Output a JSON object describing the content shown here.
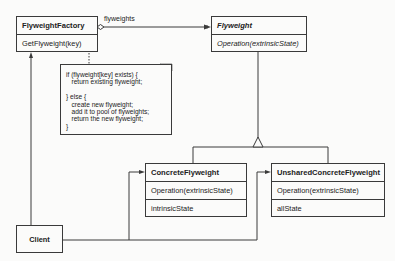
{
  "diagram": {
    "type": "UML class diagram",
    "pattern": "Flyweight",
    "classes": [
      {
        "id": "flyweight_factory",
        "name": "FlyweightFactory",
        "abstract": false,
        "operations": [
          "GetFlyweight(key)"
        ],
        "attributes": []
      },
      {
        "id": "flyweight",
        "name": "Flyweight",
        "abstract": true,
        "operations": [
          "Operation(extrinsicState)"
        ],
        "attributes": []
      },
      {
        "id": "concrete_flyweight",
        "name": "ConcreteFlyweight",
        "abstract": false,
        "operations": [
          "Operation(extrinsicState)"
        ],
        "attributes": [
          "intrinsicState"
        ]
      },
      {
        "id": "unshared_concrete_flyweight",
        "name": "UnsharedConcreteFlyweight",
        "abstract": false,
        "operations": [
          "Operation(extrinsicState)"
        ],
        "attributes": [
          "allState"
        ]
      },
      {
        "id": "client",
        "name": "Client",
        "abstract": false,
        "operations": [],
        "attributes": []
      }
    ],
    "note": {
      "attached_to": "GetFlyweight(key)",
      "lines": [
        "if (flyweight[key] exists) {",
        "   return existing flyweight;",
        "",
        "} else {",
        "   create new flyweight;",
        "   add it to pool of flyweights;",
        "   return the new flyweight;",
        "}"
      ]
    },
    "relationships": [
      {
        "from": "FlyweightFactory",
        "to": "Flyweight",
        "kind": "aggregation",
        "label": "flyweights"
      },
      {
        "from": "ConcreteFlyweight",
        "to": "Flyweight",
        "kind": "inheritance"
      },
      {
        "from": "UnsharedConcreteFlyweight",
        "to": "Flyweight",
        "kind": "inheritance"
      },
      {
        "from": "Client",
        "to": "FlyweightFactory",
        "kind": "association"
      },
      {
        "from": "Client",
        "to": "ConcreteFlyweight",
        "kind": "association"
      },
      {
        "from": "Client",
        "to": "UnsharedConcreteFlyweight",
        "kind": "association"
      }
    ]
  },
  "labels": {
    "factory_title": "FlyweightFactory",
    "factory_op": "GetFlyweight(key)",
    "flyweight_title": "Flyweight",
    "flyweight_op": "Operation(extrinsicState)",
    "concrete_title": "ConcreteFlyweight",
    "concrete_op": "Operation(extrinsicState)",
    "concrete_attr": "intrinsicState",
    "unshared_title": "UnsharedConcreteFlyweight",
    "unshared_op": "Operation(extrinsicState)",
    "unshared_attr": "allState",
    "client_title": "Client",
    "assoc_label": "flyweights",
    "note_text": "if (flyweight[key] exists) {\n   return existing flyweight;\n\n} else {\n   create new flyweight;\n   add it to pool of flyweights;\n   return the new flyweight;\n}"
  },
  "colors": {
    "line": "#3a3a3a",
    "background": "#fbfbfa",
    "text": "#222222"
  }
}
